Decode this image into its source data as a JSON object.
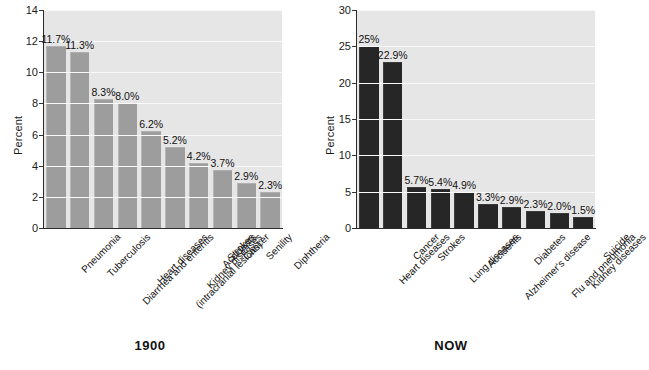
{
  "chart_data": [
    {
      "type": "bar",
      "title": "1900",
      "ylabel": "Percent",
      "xlabel": "",
      "ylim": [
        0,
        14
      ],
      "yticks": [
        0,
        2,
        4,
        6,
        8,
        10,
        12,
        14
      ],
      "grid": true,
      "legend": "none",
      "bar_color": "#9d9d9d",
      "plot_background": "#e6e6e6",
      "categories": [
        "Pneumonia",
        "Tuberculosis",
        "Diarrhea and enteritis",
        "Heart diseases",
        "Strokes (intracranial lesions)",
        "Kidney diseases",
        "Accidents",
        "Cancer",
        "Senility",
        "Diphtheria"
      ],
      "category_lines": [
        [
          "Pneumonia"
        ],
        [
          "Tuberculosis"
        ],
        [
          "Diarrhea and enteritis"
        ],
        [
          "Heart diseases"
        ],
        [
          "Strokes",
          "(intracranial lesions)"
        ],
        [
          "Kidney diseases"
        ],
        [
          "Accidents"
        ],
        [
          "Cancer"
        ],
        [
          "Senility"
        ],
        [
          "Diphtheria"
        ]
      ],
      "values": [
        11.7,
        11.3,
        8.3,
        8.0,
        6.2,
        5.2,
        4.2,
        3.7,
        2.9,
        2.3
      ],
      "data_labels": [
        "11.7%",
        "11.3%",
        "8.3%",
        "8.0%",
        "6.2%",
        "5.2%",
        "4.2%",
        "3.7%",
        "2.9%",
        "2.3%"
      ]
    },
    {
      "type": "bar",
      "title": "NOW",
      "ylabel": "Percent",
      "xlabel": "",
      "ylim": [
        0,
        30
      ],
      "yticks": [
        0,
        5,
        10,
        15,
        20,
        25,
        30
      ],
      "grid": true,
      "legend": "none",
      "bar_color": "#262626",
      "plot_background": "#e6e6e6",
      "categories": [
        "Heart diseases",
        "Cancer",
        "Strokes",
        "Lung diseases",
        "Accidents",
        "Alzheimer's disease",
        "Diabetes",
        "Flu and pneumonia",
        "Kidney diseases",
        "Suicide"
      ],
      "category_lines": [
        [
          "Heart diseases"
        ],
        [
          "Cancer"
        ],
        [
          "Strokes"
        ],
        [
          "Lung diseases"
        ],
        [
          "Accidents"
        ],
        [
          "Alzheimer's disease"
        ],
        [
          "Diabetes"
        ],
        [
          "Flu and pneumonia"
        ],
        [
          "Kidney diseases"
        ],
        [
          "Suicide"
        ]
      ],
      "values": [
        25,
        22.9,
        5.7,
        5.4,
        4.9,
        3.3,
        2.9,
        2.3,
        2.0,
        1.5
      ],
      "data_labels": [
        "25%",
        "22.9%",
        "5.7%",
        "5.4%",
        "4.9%",
        "3.3%",
        "2.9%",
        "2.3%",
        "2.0%",
        "1.5%"
      ]
    }
  ]
}
